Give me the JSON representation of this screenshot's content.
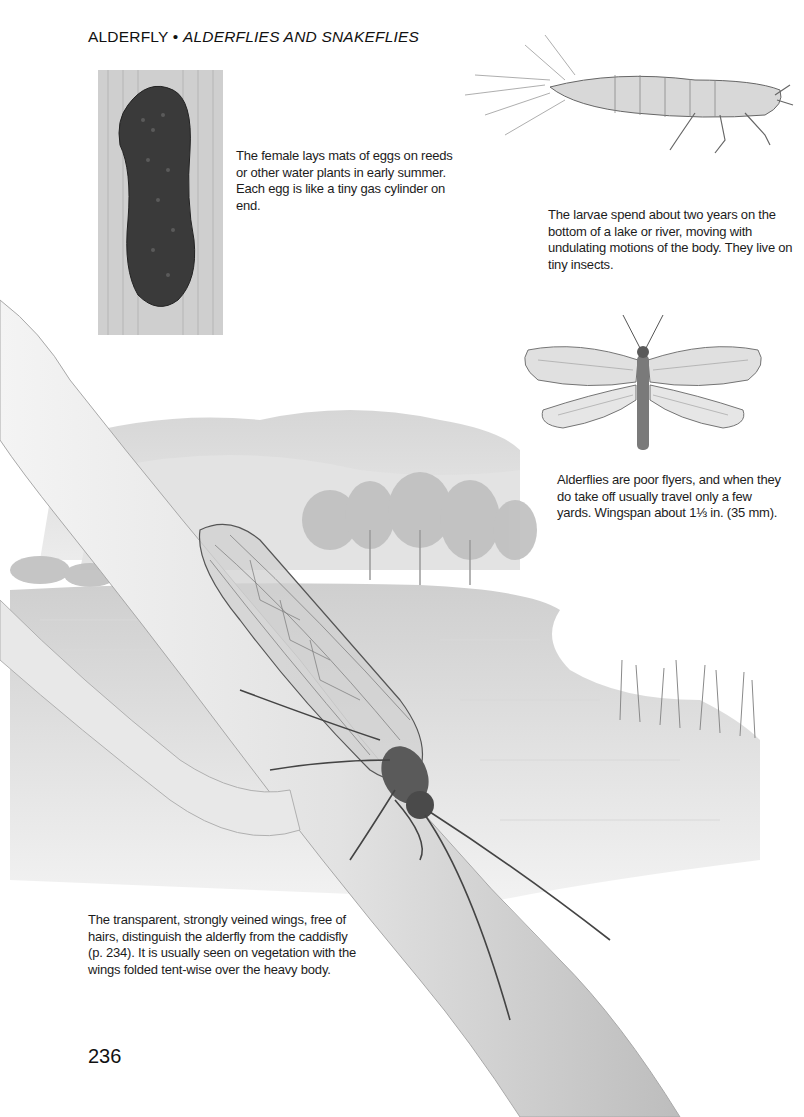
{
  "header": {
    "title": "ALDERFLY",
    "separator": " • ",
    "subtitle": "ALDERFLIES AND SNAKEFLIES"
  },
  "captions": {
    "eggs": "The female lays mats of eggs on reeds or other water plants in early summer. Each egg is like a tiny gas cylinder on end.",
    "larvae": "The larvae spend about two years on the bottom of a lake or river, moving with undulating motions of the body. They live on tiny insects.",
    "adult_flight": "Alderflies are poor flyers, and when they do take off usually travel only a few yards. Wingspan about 1⅓ in. (35 mm).",
    "wings": "The transparent, strongly veined wings, free of hairs, distinguish the alderfly from the caddisfly (p. 234). It is usually seen on vegetation with the wings folded tent-wise over the heavy body."
  },
  "illustrations": {
    "eggs": "egg-mat-on-reed",
    "larva": "alderfly-larva",
    "adult_spread": "alderfly-wings-spread",
    "scene": "alderfly-on-branch-by-lake"
  },
  "page_number": "236"
}
